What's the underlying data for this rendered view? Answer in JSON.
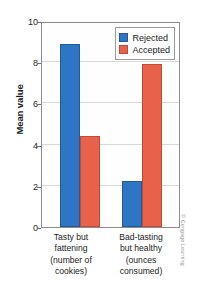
{
  "chart_data": {
    "type": "bar",
    "title": "",
    "xlabel": "",
    "ylabel": "Mean value",
    "ylim": [
      0,
      10
    ],
    "yticks": [
      0,
      2,
      4,
      6,
      8,
      10
    ],
    "grid": true,
    "legend_position": "top-right",
    "categories": [
      "Tasty but fattening (number of cookies)",
      "Bad-tasting but healthy (ounces consumed)"
    ],
    "category_lines": [
      [
        "Tasty but",
        "fattening",
        "(number of",
        "cookies)"
      ],
      [
        "Bad-tasting",
        "but healthy",
        "(ounces",
        "consumed)"
      ]
    ],
    "series": [
      {
        "name": "Rejected",
        "color": "#2e75c4",
        "values": [
          8.9,
          2.25
        ]
      },
      {
        "name": "Accepted",
        "color": "#e8614a",
        "values": [
          4.4,
          7.9
        ]
      }
    ]
  },
  "attribution": {
    "text": "© Cengage Learning"
  }
}
